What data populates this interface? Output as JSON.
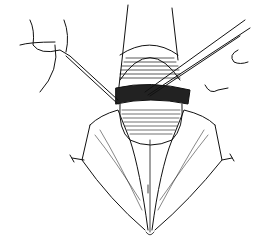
{
  "illustration": {
    "kind": "surgical line drawing",
    "subject": "dissection with forceps and retracted tissue flaps",
    "background": "#ffffff",
    "ink": "#111111",
    "instruments": [
      "left-retractor-hook",
      "right-forceps",
      "right-retractor"
    ]
  }
}
